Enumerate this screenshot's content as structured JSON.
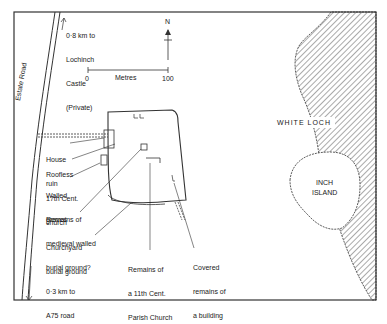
{
  "map": {
    "north_label": "N",
    "scale": {
      "start": "0",
      "unit": "Metres",
      "end": "100"
    },
    "road_label": "Estate Road",
    "water": {
      "name": "WHITE LOCH",
      "color": "#555555"
    },
    "island": {
      "name_line1": "INCH",
      "name_line2": "ISLAND"
    },
    "labels": {
      "castle": [
        "0·8 km to",
        "Lochinch",
        "Castle",
        "(Private)"
      ],
      "a75": [
        "0·3 km to",
        "A75 road"
      ],
      "house_ruin": [
        "House",
        "ruin"
      ],
      "roofless_church": [
        "Roofless",
        "17th Cent.",
        "church"
      ],
      "walled_graves": [
        "Walled",
        "graves"
      ],
      "medieval": [
        "Remains of",
        "medieval walled",
        "burial ground?"
      ],
      "churchyard": [
        "Churchyard",
        "burial ground"
      ],
      "parish_church": [
        "Remains of",
        "a 11th Cent.",
        "Parish Church"
      ],
      "covered_building": [
        "Covered",
        "remains of",
        "a building"
      ]
    }
  }
}
